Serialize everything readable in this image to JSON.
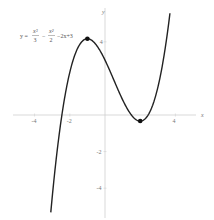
{
  "chart_data": {
    "type": "line",
    "title": "",
    "equation": {
      "lhs": "y =",
      "term1_num": "x³",
      "term1_den": "3",
      "minus1": "−",
      "term2_num": "x²",
      "term2_den": "2",
      "rest": "−2x+3"
    },
    "function": "x^3/3 - x^2/2 - 2x + 3",
    "xlabel": "x",
    "ylabel": "y",
    "xlim": [
      -5.2,
      5.0
    ],
    "ylim": [
      -5.8,
      5.8
    ],
    "x_ticks": [
      {
        "value": -4,
        "label": "-4"
      },
      {
        "value": -2,
        "label": "-2"
      },
      {
        "value": 4,
        "label": "4"
      }
    ],
    "y_ticks": [
      {
        "value": 4,
        "label": "4"
      },
      {
        "value": -2,
        "label": "-2"
      },
      {
        "value": -4,
        "label": "-4"
      }
    ],
    "domain": [
      -3.08,
      3.69
    ],
    "critical_points": [
      {
        "name": "local maximum",
        "x": -1,
        "y": 4.17
      },
      {
        "name": "local minimum",
        "x": 2,
        "y": -0.33
      }
    ],
    "grid": false,
    "legend": null,
    "colors": {
      "curve": "#222222",
      "axis": "#cfcfcf",
      "point": "#111111"
    }
  }
}
